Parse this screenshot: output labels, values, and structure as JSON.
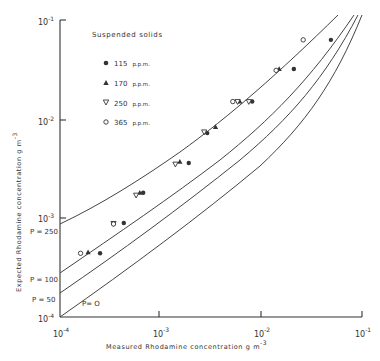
{
  "chart_data": {
    "type": "scatter",
    "title": "",
    "xlabel": "Measured Rhodamine concentration g m^-3",
    "ylabel": "Expected Rhodamine concentration g m^-3",
    "xscale": "log",
    "yscale": "log",
    "xlim": [
      0.0001,
      0.1
    ],
    "ylim": [
      0.0001,
      0.1
    ],
    "x_ticks": [
      "10^-4",
      "10^-3",
      "10^-2",
      "10^-1"
    ],
    "y_ticks": [
      "10^-4",
      "10^-3",
      "10^-2",
      "10^-1"
    ],
    "grid": false,
    "legend": {
      "title": "Suspended solids",
      "position": "upper-left",
      "entries": [
        {
          "marker": "filled-circle",
          "label": "115 p.p.m."
        },
        {
          "marker": "filled-triangle-up",
          "label": "170 p.p.m."
        },
        {
          "marker": "open-triangle-down",
          "label": "250 p.p.m."
        },
        {
          "marker": "open-circle",
          "label": "365 p.p.m."
        }
      ]
    },
    "series": [
      {
        "name": "115 p.p.m.",
        "marker": "filled-circle",
        "points": [
          [
            0.00025,
            0.00044
          ],
          [
            0.00043,
            0.00089
          ],
          [
            0.00067,
            0.0018
          ],
          [
            0.0019,
            0.0036
          ],
          [
            0.0029,
            0.0072
          ],
          [
            0.0081,
            0.015
          ],
          [
            0.021,
            0.032
          ],
          [
            0.049,
            0.063
          ]
        ]
      },
      {
        "name": "170 p.p.m.",
        "marker": "filled-triangle-up",
        "points": [
          [
            0.00019,
            0.00045
          ],
          [
            0.00062,
            0.0018
          ],
          [
            0.00155,
            0.0037
          ],
          [
            0.0035,
            0.0083
          ],
          [
            0.0061,
            0.015
          ],
          [
            0.015,
            0.032
          ]
        ]
      },
      {
        "name": "250 p.p.m.",
        "marker": "open-triangle-down",
        "points": [
          [
            0.00034,
            0.00088
          ],
          [
            0.00057,
            0.0017
          ],
          [
            0.0014,
            0.0035
          ],
          [
            0.0027,
            0.0074
          ],
          [
            0.0058,
            0.015
          ],
          [
            0.0075,
            0.015
          ]
        ]
      },
      {
        "name": "365 p.p.m.",
        "marker": "open-circle",
        "points": [
          [
            0.00016,
            0.00044
          ],
          [
            0.00034,
            0.00087
          ],
          [
            0.0052,
            0.015
          ],
          [
            0.014,
            0.031
          ],
          [
            0.026,
            0.063
          ]
        ]
      }
    ],
    "curves": [
      {
        "name": "P = 250",
        "label": "P = 250",
        "y_at_xmin": 0.00093
      },
      {
        "name": "P = 100",
        "label": "P = 100",
        "y_at_xmin": 0.00031
      },
      {
        "name": "P = 50",
        "label": "P = 50",
        "y_at_xmin": 0.00019
      },
      {
        "name": "P = 0",
        "label": "P= O",
        "y_at_xmin": 0.0001
      }
    ],
    "annotations": [
      "P = 250",
      "P = 100",
      "P = 50",
      "P= O"
    ]
  },
  "axes": {
    "x": {
      "title_main": "Measured  Rhodamine  concentration  g m",
      "title_exp": "-3",
      "ticks": [
        {
          "base": "10",
          "exp": "-4"
        },
        {
          "base": "10",
          "exp": "-3"
        },
        {
          "base": "10",
          "exp": "-2"
        },
        {
          "base": "10",
          "exp": "-1"
        }
      ]
    },
    "y": {
      "title_main": "Expected  Rhodamine  concentration  g m",
      "title_exp": "-3",
      "ticks": [
        {
          "base": "10",
          "exp": "-4"
        },
        {
          "base": "10",
          "exp": "-3"
        },
        {
          "base": "10",
          "exp": "-2"
        },
        {
          "base": "10",
          "exp": "-1"
        }
      ]
    }
  },
  "legend": {
    "title": "Suspended  solids",
    "items": [
      {
        "value": "115",
        "unit": "p.p.m."
      },
      {
        "value": "170",
        "unit": "p.p.m."
      },
      {
        "value": "250",
        "unit": "p.p.m."
      },
      {
        "value": "365",
        "unit": "p.p.m."
      }
    ]
  },
  "curve_labels": [
    "P = 250",
    "P = 100",
    "P = 50",
    "P= O"
  ]
}
